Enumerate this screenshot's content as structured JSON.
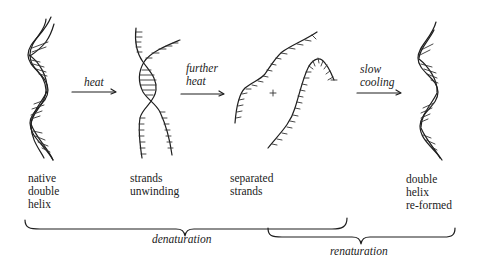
{
  "figure": {
    "stages": [
      {
        "id": "native",
        "label_lines": [
          "native",
          "double",
          "helix"
        ]
      },
      {
        "id": "unwinding",
        "label_lines": [
          "strands",
          "unwinding"
        ]
      },
      {
        "id": "separated",
        "label_lines": [
          "separated",
          "strands"
        ]
      },
      {
        "id": "reformed",
        "label_lines": [
          "double",
          "helix",
          "re-formed"
        ]
      }
    ],
    "arrows": [
      {
        "id": "heat",
        "label_lines": [
          "heat"
        ]
      },
      {
        "id": "further-heat",
        "label_lines": [
          "further",
          "heat"
        ]
      },
      {
        "id": "slow-cooling",
        "label_lines": [
          "slow",
          "cooling"
        ]
      }
    ],
    "braces": [
      {
        "id": "denaturation",
        "label": "denaturation",
        "spans": [
          "native",
          "unwinding",
          "separated"
        ]
      },
      {
        "id": "renaturation",
        "label": "renaturation",
        "spans": [
          "separated",
          "reformed"
        ]
      }
    ],
    "plus_symbol": "+",
    "colors": {
      "ink": "#1e1e1e",
      "background": "#ffffff"
    }
  }
}
